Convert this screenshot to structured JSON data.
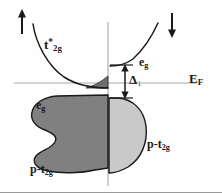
{
  "figure": {
    "kind": "spin-resolved-density-of-states",
    "background_color": "#fefefe",
    "line_color": "#1a1a1a",
    "axis_color": "#9a9a9a"
  },
  "axes": {
    "fermi_level_label": "E",
    "fermi_level_sub": "F",
    "fermi_line_y": 83,
    "vertical_axis_x": 108
  },
  "spin_markers": {
    "up": {
      "glyph": "↑",
      "name": "spin-up-arrow"
    },
    "down": {
      "glyph": "↓",
      "name": "spin-down-arrow"
    }
  },
  "bands": [
    {
      "id": "t2g-star",
      "label_main": "t",
      "label_sup": "*",
      "label_sub": "2g",
      "side": "left",
      "spin": "up",
      "fill": "#6b6b6b"
    },
    {
      "id": "eg-right",
      "label_main": "e",
      "label_sup": "",
      "label_sub": "g",
      "side": "right",
      "spin": "down",
      "fill": "none"
    },
    {
      "id": "eg-left",
      "label_main": "e",
      "label_sup": "",
      "label_sub": "g",
      "side": "left",
      "spin": "up",
      "fill": "#808080"
    },
    {
      "id": "p-t2g-left",
      "label_main": "p-t",
      "label_sup": "",
      "label_sub": "2g",
      "side": "left",
      "spin": "up",
      "fill": "#808080"
    },
    {
      "id": "p-t2g-right",
      "label_main": "p-t",
      "label_sup": "",
      "label_sub": "2g",
      "side": "right",
      "spin": "down",
      "fill": "#c9c9c9"
    }
  ],
  "gap": {
    "symbol": "Δ",
    "subscript": "↓",
    "name": "exchange-gap-delta",
    "top_y": 65,
    "bottom_y": 98
  },
  "colors": {
    "dark_fill": "#6f6f6f",
    "mid_fill": "#808080",
    "light_fill": "#c9c9c9",
    "stroke": "#1a1a1a",
    "axis": "#9a9a9a"
  }
}
